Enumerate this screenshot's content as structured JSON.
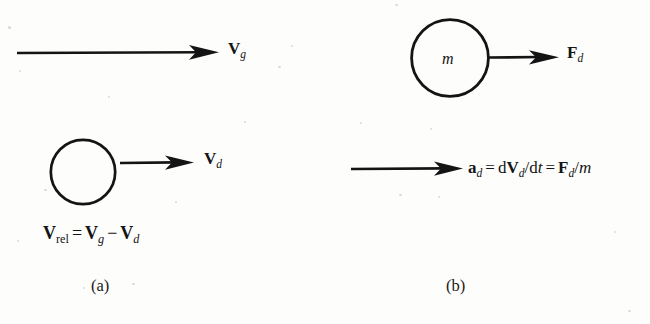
{
  "figure": {
    "background_color": "#fdfdfc",
    "ink_color": "#141414",
    "panels": [
      {
        "id": "a",
        "caption": "(a)",
        "gas_arrow": {
          "name": "gas-velocity-arrow",
          "label_vector": "V",
          "label_subscript": "g"
        },
        "droplet": {
          "name": "droplet-circle",
          "inner_label": ""
        },
        "droplet_arrow": {
          "name": "droplet-velocity-arrow",
          "label_vector": "V",
          "label_subscript": "d"
        },
        "equation": {
          "name": "relative-velocity-equation",
          "plain": "Vrel = Vg - Vd",
          "tokens": [
            {
              "text": "V",
              "style": "bold-up"
            },
            {
              "text": "rel",
              "style": "sub-up"
            },
            {
              "text": "=",
              "style": "op"
            },
            {
              "text": "V",
              "style": "bold-up"
            },
            {
              "text": "g",
              "style": "sub-ital"
            },
            {
              "text": "−",
              "style": "op"
            },
            {
              "text": "V",
              "style": "bold-up"
            },
            {
              "text": "d",
              "style": "sub-ital"
            }
          ]
        }
      },
      {
        "id": "b",
        "caption": "(b)",
        "droplet": {
          "name": "mass-circle",
          "inner_label": "m"
        },
        "force_arrow": {
          "name": "drag-force-arrow",
          "label_vector": "F",
          "label_subscript": "d"
        },
        "accel_arrow": {
          "name": "droplet-acceleration-arrow"
        },
        "equation": {
          "name": "acceleration-equation",
          "plain": "ad = dVd/dt = Fd/m",
          "tokens": [
            {
              "text": "a",
              "style": "bold-up"
            },
            {
              "text": "d",
              "style": "sub-ital"
            },
            {
              "text": "=",
              "style": "op"
            },
            {
              "text": "d",
              "style": "up"
            },
            {
              "text": "V",
              "style": "bold-up"
            },
            {
              "text": "d",
              "style": "sub-ital"
            },
            {
              "text": "/",
              "style": "slash"
            },
            {
              "text": "d",
              "style": "up"
            },
            {
              "text": "t",
              "style": "ital"
            },
            {
              "text": "=",
              "style": "op"
            },
            {
              "text": "F",
              "style": "bold-up"
            },
            {
              "text": "d",
              "style": "sub-ital"
            },
            {
              "text": "/",
              "style": "slash"
            },
            {
              "text": "m",
              "style": "ital"
            }
          ]
        }
      }
    ]
  }
}
